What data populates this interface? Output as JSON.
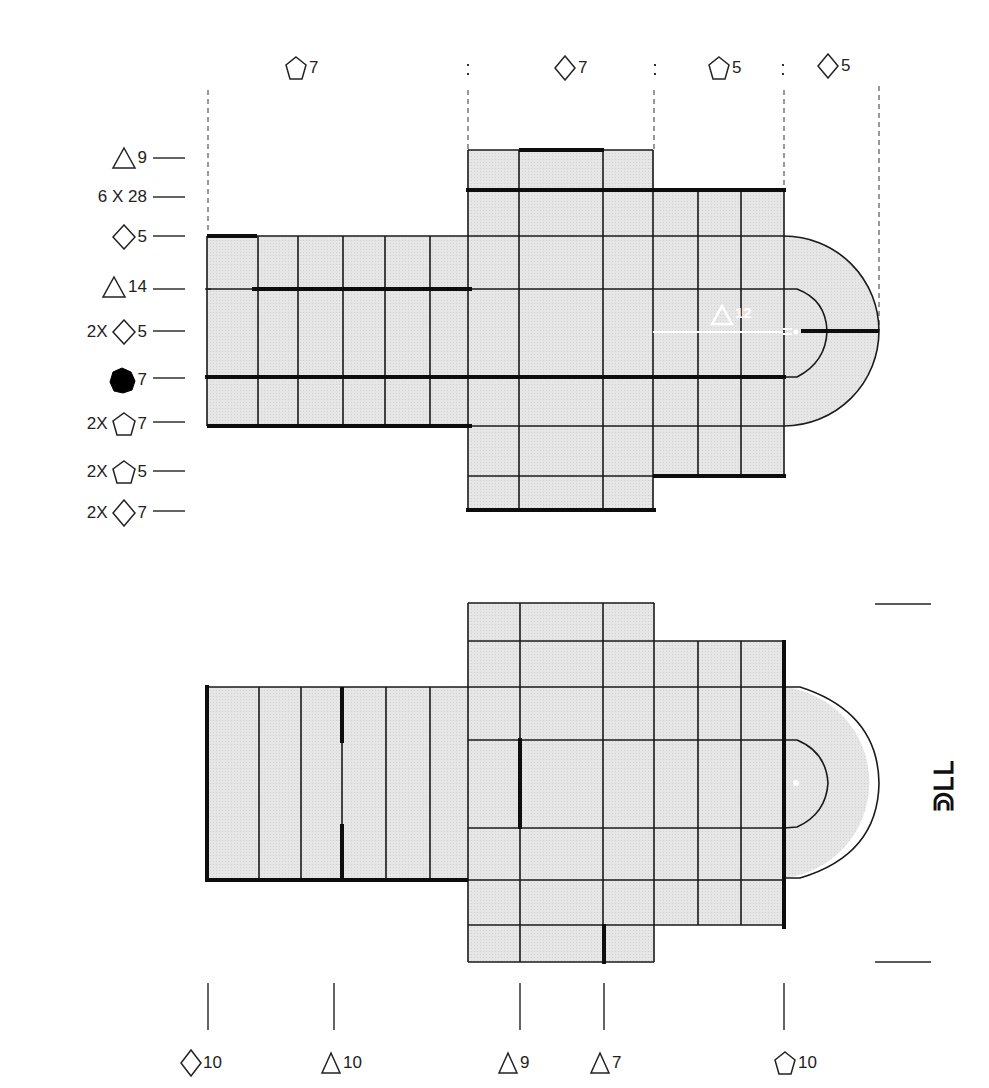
{
  "top_diagram": {
    "column_labels": [
      {
        "shape": "pentagon",
        "value": "7",
        "x": 287
      },
      {
        "shape": "diamond",
        "value": "7",
        "x": 555
      },
      {
        "shape": "pentagon",
        "value": "5",
        "x": 705
      },
      {
        "shape": "diamond",
        "value": "5",
        "x": 818
      }
    ],
    "separators": [
      ":",
      ":",
      ":"
    ],
    "row_labels": [
      {
        "prefix": "",
        "shape": "triangle",
        "value": "9",
        "y": 158
      },
      {
        "prefix": "6 X 28",
        "shape": "",
        "value": "",
        "y": 197
      },
      {
        "prefix": "",
        "shape": "diamond",
        "value": "5",
        "y": 236
      },
      {
        "prefix": "",
        "shape": "triangle",
        "value": "14",
        "y": 289
      },
      {
        "prefix": "2X",
        "shape": "diamond",
        "value": "5",
        "y": 331
      },
      {
        "prefix": "",
        "shape": "heptagon-filled",
        "value": "7",
        "y": 378
      },
      {
        "prefix": "2X",
        "shape": "pentagon",
        "value": "7",
        "y": 424
      },
      {
        "prefix": "2X",
        "shape": "pentagon",
        "value": "5",
        "y": 472
      },
      {
        "prefix": "2X",
        "shape": "diamond",
        "value": "7",
        "y": 512
      }
    ],
    "inner_label": {
      "shape": "triangle",
      "value": "12",
      "color": "#ffffff"
    }
  },
  "bottom_diagram": {
    "column_labels": [
      {
        "shape": "diamond",
        "value": "10",
        "x": 207
      },
      {
        "shape": "triangle",
        "value": "10",
        "x": 334
      },
      {
        "shape": "triangle",
        "value": "9",
        "x": 520
      },
      {
        "shape": "triangle",
        "value": "7",
        "x": 604
      },
      {
        "shape": "pentagon",
        "value": "10",
        "x": 784
      }
    ],
    "side_text": "ᒣᒣᕳ"
  },
  "colors": {
    "fill": "#e4e4e4",
    "line": "#1a1a1a",
    "thick": "#0d0d0d",
    "background": "#ffffff",
    "highlight": "#ffffff"
  }
}
